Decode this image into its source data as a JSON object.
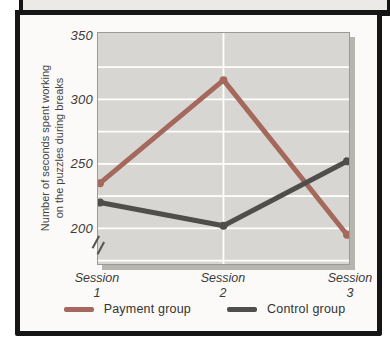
{
  "figure": {
    "frame_color": "#161616",
    "paper_color": "#fbfaf8",
    "plot_bg": "#d8d6d2",
    "gridline_color": "#ffffff"
  },
  "chart_data": {
    "type": "line",
    "title": "",
    "categories": [
      "Session 1",
      "Session 2",
      "Session 3"
    ],
    "x_tick_labels": [
      {
        "top": "Session",
        "bottom": "1"
      },
      {
        "top": "Session",
        "bottom": "2"
      },
      {
        "top": "Session",
        "bottom": "3"
      }
    ],
    "series": [
      {
        "name": "Payment group",
        "values": [
          235,
          315,
          195
        ],
        "color": "#a4685c"
      },
      {
        "name": "Control group",
        "values": [
          220,
          202,
          252
        ],
        "color": "#4f4e4c"
      }
    ],
    "ylabel": "Number of seconds spent working on the puzzles during breaks",
    "ylabel_lines": [
      "Number of seconds spent working",
      "on the puzzles during breaks"
    ],
    "yticks": [
      350,
      300,
      250,
      200
    ],
    "grid_interval": 25,
    "gridlines_at": [
      325,
      300,
      275,
      250,
      225,
      200,
      175
    ],
    "ylim": [
      172,
      352
    ],
    "axis_break": true,
    "grid": {
      "horizontal": true,
      "vertical_at": "Session 2"
    },
    "legend_position": "bottom",
    "marker": "dot"
  }
}
